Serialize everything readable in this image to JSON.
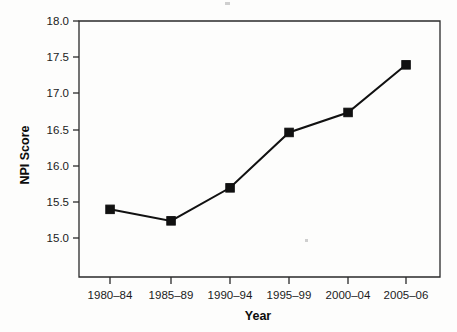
{
  "chart_data": {
    "type": "line",
    "title": "",
    "subtitle": "",
    "xlabel": "Year",
    "ylabel": "NPI Score",
    "categories": [
      "1980–84",
      "1985–89",
      "1990–94",
      "1995–99",
      "2000–04",
      "2005–06"
    ],
    "values": [
      15.55,
      15.4,
      15.83,
      16.55,
      16.81,
      17.43
    ],
    "series": [
      {
        "name": "NPI Score",
        "values": [
          15.55,
          15.4,
          15.83,
          16.55,
          16.81,
          17.43
        ]
      }
    ],
    "ylim": [
      14.67,
      18.0
    ],
    "y_ticks": [
      "15.0",
      "15.5",
      "16.0",
      "16.5",
      "17.0",
      "17.5",
      "18.0"
    ],
    "y_tick_values": [
      15.0,
      15.5,
      16.0,
      16.5,
      17.0,
      17.5,
      18.0
    ],
    "x_tick_labels": [
      "1980–84",
      "1985–89",
      "1990–94",
      "1995–99",
      "2000–04",
      "2005–06"
    ],
    "grid": false,
    "legend": false,
    "legend_position": "none",
    "marker": "square",
    "line_color": "#111111",
    "marker_color": "#111111",
    "axis_color": "#2a2a2a",
    "background_color": "#fdfdfc",
    "annotations": []
  },
  "axes": {
    "y_title": "NPI Score",
    "x_title": "Year"
  },
  "y_ticks": [
    {
      "label": "18.0"
    },
    {
      "label": "17.5"
    },
    {
      "label": "17.0"
    },
    {
      "label": "16.5"
    },
    {
      "label": "16.0"
    },
    {
      "label": "15.5"
    },
    {
      "label": "15.0"
    }
  ],
  "x_ticks": [
    {
      "label": "1980–84"
    },
    {
      "label": "1985–89"
    },
    {
      "label": "1990–94"
    },
    {
      "label": "1995–99"
    },
    {
      "label": "2000–04"
    },
    {
      "label": "2005–06"
    }
  ]
}
